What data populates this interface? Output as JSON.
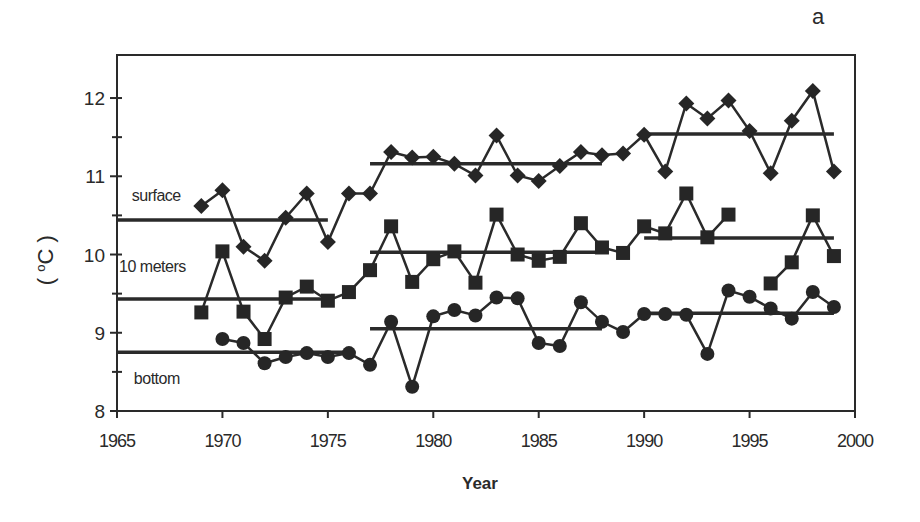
{
  "chart_data": {
    "type": "line",
    "panel_label": "a",
    "title": "",
    "xlabel": "Year",
    "ylabel": "(°C)",
    "xlim": [
      1965,
      2000
    ],
    "ylim": [
      8,
      12.5
    ],
    "xticks": [
      1965,
      1970,
      1975,
      1980,
      1985,
      1990,
      1995,
      2000
    ],
    "yticks": [
      8,
      9,
      10,
      11,
      12
    ],
    "yminor_ticks": [
      8.5,
      9.5,
      10.5,
      11.5
    ],
    "grid": false,
    "legend": "inline text labels",
    "x": [
      1969,
      1970,
      1971,
      1972,
      1973,
      1974,
      1975,
      1976,
      1977,
      1978,
      1979,
      1980,
      1981,
      1982,
      1983,
      1984,
      1985,
      1986,
      1987,
      1988,
      1989,
      1990,
      1991,
      1992,
      1993,
      1994,
      1995,
      1996,
      1997,
      1998,
      1999
    ],
    "series": [
      {
        "name": "surface",
        "marker": "diamond",
        "label_pos": {
          "x": 1965.7,
          "y": 10.68
        },
        "values": [
          10.62,
          10.82,
          10.1,
          9.92,
          10.47,
          10.78,
          10.16,
          10.78,
          10.78,
          11.31,
          11.24,
          11.25,
          11.16,
          11.01,
          11.52,
          11.01,
          10.94,
          11.13,
          11.31,
          11.27,
          11.29,
          11.53,
          11.06,
          11.93,
          11.74,
          11.97,
          11.58,
          11.04,
          11.71,
          12.09,
          11.06
        ],
        "period_means": [
          {
            "x0": 1965,
            "x1": 1975,
            "y": 10.44
          },
          {
            "x0": 1977,
            "x1": 1988,
            "y": 11.16
          },
          {
            "x0": 1990,
            "x1": 1999,
            "y": 11.54
          }
        ]
      },
      {
        "name": "10 meters",
        "marker": "square",
        "label_pos": {
          "x": 1965.1,
          "y": 9.78
        },
        "values": [
          9.26,
          10.04,
          9.27,
          8.92,
          9.45,
          9.59,
          9.41,
          9.52,
          9.8,
          10.36,
          9.65,
          9.94,
          10.04,
          9.64,
          10.51,
          10.0,
          9.92,
          9.97,
          10.4,
          10.09,
          10.02,
          10.36,
          10.27,
          10.78,
          10.22,
          10.51,
          null,
          9.63,
          9.9,
          10.5,
          9.98
        ],
        "period_means": [
          {
            "x0": 1965,
            "x1": 1975,
            "y": 9.43
          },
          {
            "x0": 1977,
            "x1": 1988,
            "y": 10.03
          },
          {
            "x0": 1990,
            "x1": 1999,
            "y": 10.21
          }
        ]
      },
      {
        "name": "bottom",
        "marker": "circle",
        "label_pos": {
          "x": 1965.8,
          "y": 8.34
        },
        "values": [
          null,
          8.92,
          8.87,
          8.61,
          8.69,
          8.74,
          8.69,
          8.74,
          8.59,
          9.14,
          8.31,
          9.21,
          9.29,
          9.22,
          9.45,
          9.44,
          8.87,
          8.83,
          9.39,
          9.14,
          9.01,
          9.24,
          9.24,
          9.23,
          8.73,
          9.54,
          9.46,
          9.31,
          9.18,
          9.52,
          9.33
        ],
        "period_means": [
          {
            "x0": 1965,
            "x1": 1976,
            "y": 8.75
          },
          {
            "x0": 1977,
            "x1": 1988,
            "y": 9.05
          },
          {
            "x0": 1990,
            "x1": 1999,
            "y": 9.25
          }
        ]
      }
    ]
  },
  "labels": {
    "panel": "a",
    "x_axis": "Year",
    "y_axis_open": "( ",
    "y_axis_deg": "o",
    "y_axis_unit": "C )"
  },
  "colors": {
    "line": "#2a2a2a",
    "marker": "#262626",
    "frame": "#2a2a2a"
  }
}
